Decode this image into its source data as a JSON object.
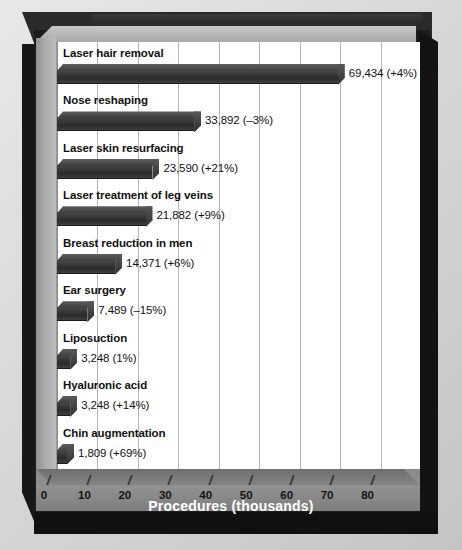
{
  "chart_data": {
    "type": "bar",
    "orientation": "horizontal",
    "title": "",
    "xlabel": "Procedures (thousands)",
    "ylabel": "",
    "xlim": [
      0,
      90
    ],
    "xticks": [
      0,
      10,
      20,
      30,
      40,
      50,
      60,
      70,
      80
    ],
    "xtick_labels": [
      "0",
      "10",
      "20",
      "30",
      "40",
      "50",
      "60",
      "70",
      "80"
    ],
    "grid": true,
    "legend": false,
    "categories": [
      "Laser hair removal",
      "Nose reshaping",
      "Laser skin resurfacing",
      "Laser treatment of leg veins",
      "Breast reduction in men",
      "Ear surgery",
      "Liposuction",
      "Hyaluronic acid",
      "Chin augmentation"
    ],
    "values": [
      69.434,
      33.892,
      23.59,
      21.882,
      14.371,
      7.489,
      3.248,
      3.248,
      1.809
    ],
    "data_labels": [
      "69,434 (+4%)",
      "33,892 (–3%)",
      "23,590 (+21%)",
      "21,882 (+9%)",
      "14,371 (+6%)",
      "7,489 (–15%)",
      "3,248 (1%)",
      "3,248 (+14%)",
      "1,809 (+69%)"
    ],
    "percent_change": [
      "+4%",
      "-3%",
      "+21%",
      "+9%",
      "+6%",
      "-15%",
      "1%",
      "+14%",
      "+69%"
    ],
    "colors": {
      "bar": "#333333",
      "bar_top": "#5e5e5e",
      "plot_background": "#ffffff",
      "grid": "#b5b5b5",
      "frame": "#1d1d1d",
      "floor": "#8a8a8a",
      "axis_title_text": "#ffffff",
      "label_text": "#111111",
      "page_background": "#d9d9d9"
    }
  }
}
